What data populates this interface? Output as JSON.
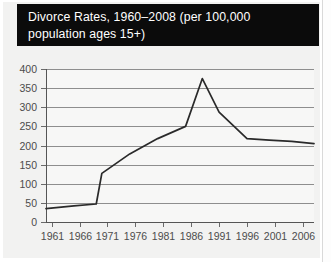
{
  "figure": {
    "title_line1": "Divorce Rates, 1960–2008 (per 100,000",
    "title_line2": "population ages 15+)",
    "title_full": "Divorce Rates, 1960–2008 (per 100,000 population ages 15+)",
    "title_bar_color": "#0b0b0b",
    "title_text_color": "#ffffff",
    "panel_color": "#f2f2f1",
    "plot_bg_color": "#f7f7f6",
    "gridline_color": "#8e8e8e",
    "line_color": "#2a2a2a"
  },
  "chart_data": {
    "type": "line",
    "title": "Divorce Rates, 1960–2008 (per 100,000 population ages 15+)",
    "xlabel": "",
    "ylabel": "",
    "xlim": [
      1960,
      2008
    ],
    "ylim": [
      0,
      400
    ],
    "ytick_step": 50,
    "yticks": [
      0,
      50,
      100,
      150,
      200,
      250,
      300,
      350,
      400
    ],
    "ytick_labels": [
      "0",
      "50",
      "100",
      "150",
      "200",
      "250",
      "300",
      "350",
      "400"
    ],
    "xticks": [
      1961,
      1966,
      1971,
      1976,
      1981,
      1986,
      1991,
      1996,
      2001,
      2006
    ],
    "xtick_labels": [
      "1961",
      "1966",
      "1971",
      "1976",
      "1981",
      "1986",
      "1991",
      "1996",
      "2001",
      "2006"
    ],
    "grid": true,
    "grid_axis": "y",
    "legend": false,
    "legend_position": "none",
    "series": [
      {
        "name": "Divorce rate",
        "x": [
          1960,
          1965,
          1969,
          1970,
          1975,
          1980,
          1985,
          1988,
          1991,
          1996,
          2000,
          2004,
          2008
        ],
        "values": [
          35,
          42,
          47,
          127,
          178,
          218,
          250,
          375,
          287,
          218,
          214,
          211,
          205
        ]
      }
    ]
  }
}
